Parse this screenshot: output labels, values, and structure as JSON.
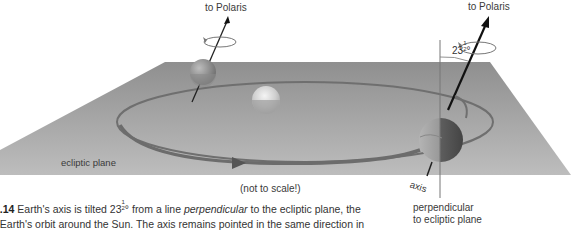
{
  "figure": {
    "labels": {
      "polaris_left": "to Polaris",
      "polaris_right": "to Polaris",
      "angle_whole": "23",
      "angle_num": "1",
      "angle_den": "2",
      "angle_unit": "°",
      "ecliptic_plane": "ecliptic plane",
      "not_to_scale": "(not to scale!)",
      "axis": "axis",
      "perpendicular_line1": "perpendicular",
      "perpendicular_line2": "to ecliptic plane"
    },
    "caption": {
      "fig_number": "1.14",
      "line1_a": "Earth's axis is tilted 23",
      "line1_num": "1",
      "line1_den": "2",
      "line1_b": "° from a line ",
      "line1_italic": "perpendicular",
      "line1_c": " to the ecliptic plane, the",
      "line2": "f Earth's orbit around the Sun. The axis remains pointed in the same direction in"
    },
    "colors": {
      "plane": "#a9a9a9",
      "orbit": "#7a7a7a",
      "earth_dark": "#5a5a5a",
      "sun": "#d8d8d8"
    }
  }
}
